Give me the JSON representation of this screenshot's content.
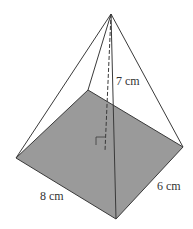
{
  "diagram": {
    "type": "rectangular-pyramid",
    "labels": {
      "height": "7 cm",
      "length": "8 cm",
      "width": "6 cm"
    },
    "colors": {
      "base_fill": "#9a9a9a",
      "edge": "#3a3a3a",
      "background": "#ffffff"
    },
    "vertices": {
      "apex": [
        111,
        14
      ],
      "base_left": [
        16,
        158
      ],
      "base_back": [
        88,
        90
      ],
      "base_right": [
        183,
        147
      ],
      "base_front": [
        116,
        219
      ],
      "height_foot": [
        105,
        151
      ]
    }
  }
}
